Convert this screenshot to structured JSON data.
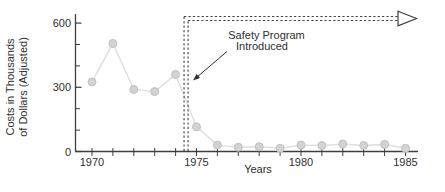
{
  "chart_data": {
    "type": "line",
    "title": "",
    "xlabel": "Years",
    "ylabel": "Costs in Thousands of Dollars (Adjusted)",
    "ylabel_lines": [
      "Costs in Thousands",
      "of Dollars (Adjusted)"
    ],
    "x": [
      1970,
      1971,
      1972,
      1973,
      1974,
      1975,
      1976,
      1977,
      1978,
      1979,
      1980,
      1981,
      1982,
      1983,
      1984,
      1985
    ],
    "values": [
      325,
      505,
      290,
      280,
      360,
      115,
      30,
      20,
      22,
      15,
      30,
      28,
      35,
      28,
      33,
      15
    ],
    "x_tick_labels": [
      "1970",
      "1975",
      "1980",
      "1985"
    ],
    "y_major_ticks": [
      0,
      300,
      600
    ],
    "y_minor_ticks": [
      100,
      200,
      400,
      500
    ],
    "xlim": [
      1969.2,
      1985.6
    ],
    "ylim": [
      0,
      620
    ],
    "grid": false,
    "legend": "none",
    "marker": "filled-circle",
    "annotation": {
      "text_lines": [
        "Safety Program",
        "Introduced"
      ],
      "event_year": 1974.5,
      "shape": "double dashed vertical line at event year turning into double dashed horizontal line with open arrowhead pointing right"
    },
    "colors": {
      "background": "#ffffff",
      "axis": "#3f3f3f",
      "text": "#2f2f2f",
      "dashed": "#3f3f3f",
      "line": "#dedede",
      "point_fill": "#d3d3d3",
      "point_stroke": "#c1c1c1",
      "arrowhead_fill": "#ffffff"
    }
  }
}
